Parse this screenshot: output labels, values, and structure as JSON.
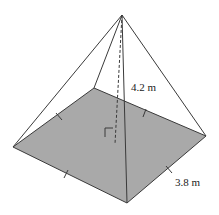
{
  "figure": {
    "type": "square-pyramid",
    "colors": {
      "base_fill": "#a9a9a9",
      "edge_stroke": "#3a3a3a",
      "background": "#ffffff"
    },
    "points": {
      "apex": [
        122,
        15
      ],
      "base_left": [
        13,
        147
      ],
      "base_front": [
        127,
        203
      ],
      "base_right": [
        206,
        136
      ],
      "base_back": [
        94,
        88
      ],
      "base_center": [
        115,
        144
      ]
    },
    "labels": {
      "height": "4.2 m",
      "base_side": "3.8 m"
    },
    "annotations": {
      "right_angle_marker": true,
      "congruent_side_ticks": 4,
      "altitude_dashed": true
    }
  }
}
